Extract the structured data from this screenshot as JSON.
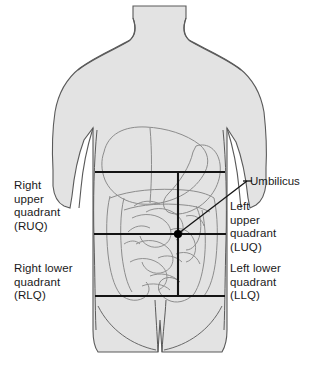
{
  "figure": {
    "background_color": "#ffffff",
    "body_fill": "#e3e3e3",
    "outline_color": "#4a4a4a",
    "quadrant_line_color": "#141414",
    "text_color": "#1a1a1a"
  },
  "labels": {
    "ruq": "Right\nupper\nquadrant\n(RUQ)",
    "luq": "Left\nupper\nquadrant\n(LUQ)",
    "rlq": "Right lower\nquadrant\n(RLQ)",
    "llq": "Left lower\nquadrant\n(LLQ)",
    "umbilicus": "Umbilicus"
  },
  "markers": {
    "umbilicus_point": {
      "x": 178,
      "y": 234
    }
  },
  "quadrant_lines": {
    "vertical_x": 178,
    "horizontal_upper_y": 172,
    "horizontal_middle_y": 234,
    "horizontal_lower_y": 296
  }
}
